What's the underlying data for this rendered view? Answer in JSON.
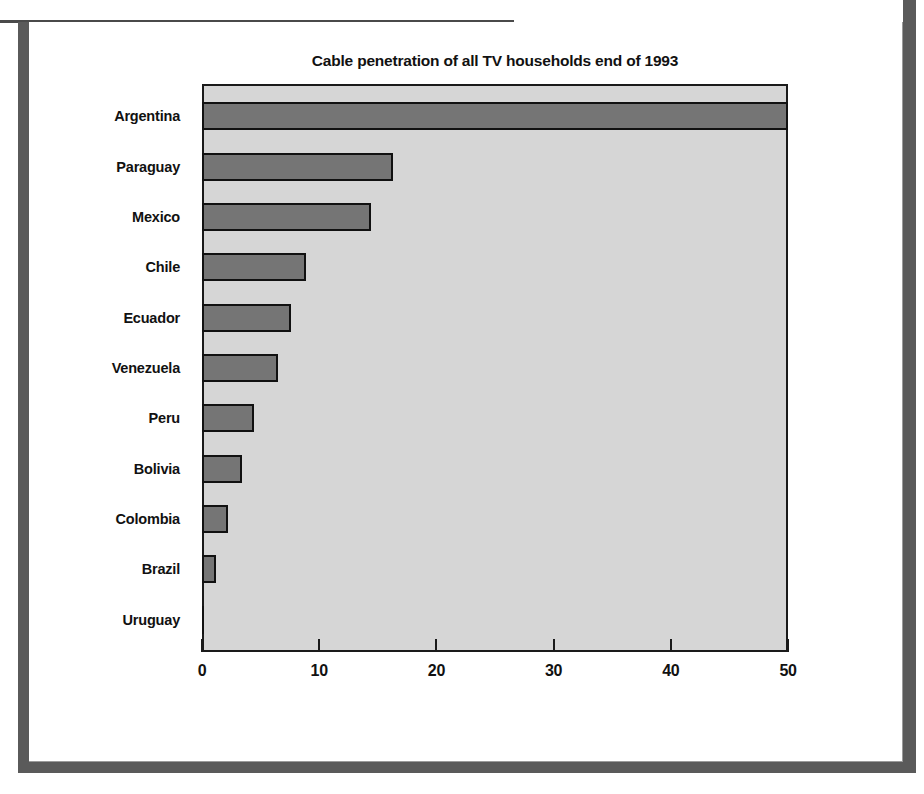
{
  "chart_data": {
    "type": "bar",
    "orientation": "horizontal",
    "title": "Cable penetration of all TV households end of 1993",
    "xlabel": "",
    "ylabel": "",
    "categories": [
      "Argentina",
      "Paraguay",
      "Mexico",
      "Chile",
      "Ecuador",
      "Venezuela",
      "Peru",
      "Bolivia",
      "Colombia",
      "Brazil",
      "Uruguay"
    ],
    "values": [
      50.0,
      16.3,
      14.4,
      8.9,
      7.6,
      6.5,
      4.4,
      3.4,
      2.2,
      1.2,
      0.2
    ],
    "xlim": [
      0,
      50
    ],
    "xticks": [
      0,
      10,
      20,
      30,
      40,
      50
    ],
    "xtick_labels": [
      "0",
      "10",
      "20",
      "30",
      "40",
      "50"
    ],
    "grid": false,
    "legend": null,
    "colors": {
      "bar_fill": "#757575",
      "bar_edge": "#111111",
      "plot_background": "#d6d6d6",
      "axis": "#1a1a1a",
      "text": "#111111",
      "page_frame": "#5a5a5a"
    }
  }
}
